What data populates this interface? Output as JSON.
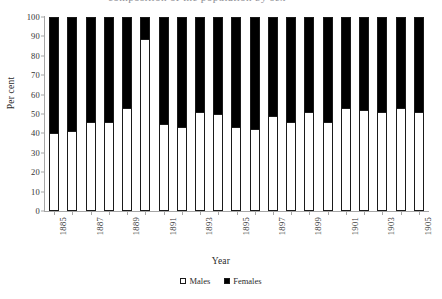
{
  "caption_clip": "composition of the population by sex",
  "legend": {
    "position": "bottom-center",
    "items": [
      {
        "label": "Males",
        "color": "#ffffff",
        "name": "males"
      },
      {
        "label": "Females",
        "color": "#000000",
        "name": "females"
      }
    ]
  },
  "chart_data": {
    "type": "bar",
    "subtype": "stacked-100-percent",
    "title": "",
    "xlabel": "Year",
    "ylabel": "Per cent",
    "ylim": [
      0,
      100
    ],
    "ytick_step": 10,
    "yticks": [
      0,
      10,
      20,
      30,
      40,
      50,
      60,
      70,
      80,
      90,
      100
    ],
    "grid": false,
    "legend_entries": [
      "Males",
      "Females"
    ],
    "categories": [
      "1885",
      "1886",
      "1887",
      "1888",
      "1889",
      "1890",
      "1891",
      "1892",
      "1893",
      "1894",
      "1895",
      "1896",
      "1897",
      "1898",
      "1899",
      "1900",
      "1901",
      "1902",
      "1903",
      "1904",
      "1905"
    ],
    "xtick_labels_shown": [
      "1885",
      "",
      "1887",
      "",
      "1889",
      "",
      "1891",
      "",
      "1893",
      "",
      "1895",
      "",
      "1897",
      "",
      "1899",
      "",
      "1901",
      "",
      "1903",
      "",
      "1905"
    ],
    "series": [
      {
        "name": "Males",
        "color": "#ffffff",
        "values": [
          40,
          41,
          46,
          46,
          53,
          89,
          45,
          43,
          51,
          50,
          43,
          42,
          49,
          46,
          51,
          46,
          53,
          52,
          51,
          53,
          51
        ]
      },
      {
        "name": "Females",
        "color": "#000000",
        "values": [
          60,
          59,
          54,
          54,
          47,
          11,
          55,
          57,
          49,
          50,
          57,
          58,
          51,
          54,
          49,
          54,
          47,
          48,
          49,
          47,
          49
        ]
      }
    ]
  }
}
